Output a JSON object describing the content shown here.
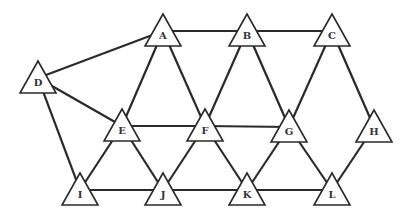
{
  "diagram": {
    "type": "graph",
    "node_shape": "triangle",
    "nodes": [
      {
        "id": "A",
        "label": "A",
        "x": 163,
        "y": 31
      },
      {
        "id": "B",
        "label": "B",
        "x": 247,
        "y": 31
      },
      {
        "id": "C",
        "label": "C",
        "x": 332,
        "y": 31
      },
      {
        "id": "D",
        "label": "D",
        "x": 38,
        "y": 78
      },
      {
        "id": "E",
        "label": "E",
        "x": 122,
        "y": 126
      },
      {
        "id": "F",
        "label": "F",
        "x": 205,
        "y": 126
      },
      {
        "id": "G",
        "label": "G",
        "x": 289,
        "y": 127
      },
      {
        "id": "H",
        "label": "H",
        "x": 374,
        "y": 127
      },
      {
        "id": "I",
        "label": "I",
        "x": 80,
        "y": 190
      },
      {
        "id": "J",
        "label": "J",
        "x": 163,
        "y": 190
      },
      {
        "id": "K",
        "label": "K",
        "x": 247,
        "y": 190
      },
      {
        "id": "L",
        "label": "L",
        "x": 332,
        "y": 190
      }
    ],
    "edges": [
      [
        "A",
        "B"
      ],
      [
        "B",
        "C"
      ],
      [
        "A",
        "D"
      ],
      [
        "D",
        "E"
      ],
      [
        "D",
        "I"
      ],
      [
        "A",
        "E"
      ],
      [
        "A",
        "F"
      ],
      [
        "B",
        "F"
      ],
      [
        "B",
        "G"
      ],
      [
        "C",
        "G"
      ],
      [
        "C",
        "H"
      ],
      [
        "E",
        "F"
      ],
      [
        "F",
        "G"
      ],
      [
        "E",
        "I"
      ],
      [
        "E",
        "J"
      ],
      [
        "F",
        "J"
      ],
      [
        "F",
        "K"
      ],
      [
        "G",
        "K"
      ],
      [
        "G",
        "L"
      ],
      [
        "H",
        "L"
      ],
      [
        "I",
        "J"
      ],
      [
        "J",
        "K"
      ],
      [
        "K",
        "L"
      ]
    ],
    "colors": {
      "stroke": "#2a2a2a",
      "fill": "#ffffff",
      "label": "#333333"
    }
  }
}
